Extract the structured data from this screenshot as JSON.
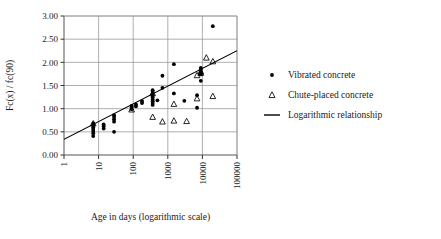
{
  "chart_data": {
    "type": "scatter",
    "title": "",
    "xlabel": "Age in days (logarithmic scale)",
    "ylabel": "Fc(x) / fc(90)",
    "xscale": "log",
    "xlim": [
      1,
      100000
    ],
    "ylim": [
      0,
      3.0
    ],
    "xticks": [
      1,
      10,
      100,
      1000,
      10000,
      100000
    ],
    "xtick_labels": [
      "1",
      "10",
      "100",
      "1000",
      "10000",
      "100000"
    ],
    "yticks": [
      0.0,
      0.5,
      1.0,
      1.5,
      2.0,
      2.5,
      3.0
    ],
    "ytick_labels": [
      "0.00",
      "0.50",
      "1.00",
      "1.50",
      "2.00",
      "2.50",
      "3.00"
    ],
    "grid": true,
    "grid_color": "#9a9a9a",
    "legend_position": "right",
    "series": [
      {
        "name": "Vibrated concrete",
        "marker": "filled-circle",
        "color": "#000000",
        "points": [
          [
            7,
            0.41
          ],
          [
            7,
            0.47
          ],
          [
            7,
            0.52
          ],
          [
            7,
            0.56
          ],
          [
            7,
            0.6
          ],
          [
            7,
            0.64
          ],
          [
            7,
            0.68
          ],
          [
            14,
            0.57
          ],
          [
            14,
            0.62
          ],
          [
            14,
            0.66
          ],
          [
            28,
            0.5
          ],
          [
            28,
            0.72
          ],
          [
            28,
            0.77
          ],
          [
            28,
            0.82
          ],
          [
            28,
            0.86
          ],
          [
            90,
            0.99
          ],
          [
            90,
            1.03
          ],
          [
            90,
            1.06
          ],
          [
            120,
            1.05
          ],
          [
            120,
            1.09
          ],
          [
            180,
            1.12
          ],
          [
            180,
            1.16
          ],
          [
            365,
            1.08
          ],
          [
            365,
            1.12
          ],
          [
            365,
            1.16
          ],
          [
            365,
            1.2
          ],
          [
            365,
            1.24
          ],
          [
            365,
            1.28
          ],
          [
            365,
            1.32
          ],
          [
            365,
            1.36
          ],
          [
            365,
            1.4
          ],
          [
            500,
            1.18
          ],
          [
            700,
            1.71
          ],
          [
            700,
            1.45
          ],
          [
            1500,
            1.96
          ],
          [
            1500,
            1.33
          ],
          [
            3000,
            1.17
          ],
          [
            7000,
            1.02
          ],
          [
            7000,
            1.29
          ],
          [
            9000,
            1.6
          ],
          [
            9000,
            1.74
          ],
          [
            9000,
            1.79
          ],
          [
            9000,
            1.84
          ],
          [
            9000,
            1.88
          ],
          [
            20000,
            2.78
          ]
        ]
      },
      {
        "name": "Chute-placed concrete",
        "marker": "open-triangle",
        "color": "#000000",
        "points": [
          [
            7,
            0.68
          ],
          [
            90,
            0.98
          ],
          [
            365,
            0.82
          ],
          [
            365,
            1.33
          ],
          [
            700,
            0.72
          ],
          [
            1500,
            1.1
          ],
          [
            1500,
            0.74
          ],
          [
            3500,
            0.73
          ],
          [
            7000,
            1.22
          ],
          [
            7000,
            1.72
          ],
          [
            9000,
            1.77
          ],
          [
            9000,
            1.8
          ],
          [
            13000,
            2.1
          ],
          [
            20000,
            2.02
          ],
          [
            20000,
            1.27
          ]
        ]
      }
    ],
    "fit_line": {
      "name": "Logarithmic relationship",
      "type": "logarithmic",
      "color": "#000000",
      "x_start": 1,
      "y_start": 0.34,
      "x_end": 100000,
      "y_end": 2.25
    }
  },
  "legend": {
    "items": [
      {
        "label": "Vibrated concrete",
        "marker": "filled-circle"
      },
      {
        "label": "Chute-placed concrete",
        "marker": "open-triangle"
      },
      {
        "label": "Logarithmic relationship",
        "marker": "line"
      }
    ]
  }
}
